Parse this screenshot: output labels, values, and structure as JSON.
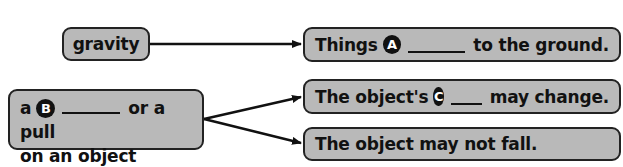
{
  "diagram": {
    "cause_box": {
      "text": "gravity"
    },
    "effect_a": {
      "prefix": "Things",
      "badge": "A",
      "suffix": "to the ground."
    },
    "cause_b": {
      "prefix": "a",
      "badge": "B",
      "suffix": "or a pull",
      "line2": "on an object"
    },
    "effect_c": {
      "prefix": "The object's",
      "badge": "C",
      "suffix": "may change."
    },
    "effect_d": {
      "text": "The object may not fall."
    },
    "colors": {
      "box_fill": "#b9b9b9",
      "border": "#222222",
      "text": "#111111",
      "badge_fill": "#111111",
      "badge_text": "#ffffff"
    }
  }
}
